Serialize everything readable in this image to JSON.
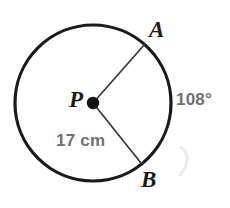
{
  "figure": {
    "kind": "circle-diagram",
    "colors": {
      "stroke": "#1a1a1a",
      "radius_line": "#3a3a3a",
      "measure_text": "#70706f",
      "point_text": "#1a1a1a",
      "background": "#ffffff",
      "ghost_arc": "#e9e9e9"
    },
    "circle": {
      "center_x": 93,
      "center_y": 103,
      "radius_px": 78,
      "stroke_width": 3
    },
    "center_dot": {
      "radius_px": 6
    },
    "points": [
      {
        "id": "A",
        "label": "A",
        "x": 145,
        "y": 44
      },
      {
        "id": "B",
        "label": "B",
        "x": 141,
        "y": 163
      },
      {
        "id": "P",
        "label": "P",
        "x": 93,
        "y": 103
      }
    ],
    "radii": [
      {
        "id": "PA",
        "from": "P",
        "to": "A"
      },
      {
        "id": "PB",
        "from": "P",
        "to": "B"
      }
    ],
    "measures": {
      "arc_angle": "108°",
      "radius_length": "17 cm"
    }
  }
}
